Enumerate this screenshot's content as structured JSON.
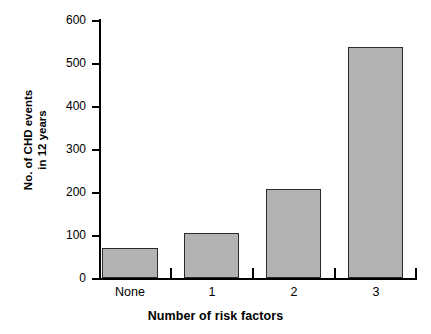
{
  "chart_data": {
    "type": "bar",
    "title": "",
    "subtitle": "",
    "xlabel": "Number of risk factors",
    "ylabel": "No. of CHD events in 12 years",
    "ylabel_lines": [
      "No. of CHD events",
      "in 12 years"
    ],
    "categories": [
      "None",
      "1",
      "2",
      "3"
    ],
    "values": [
      70,
      105,
      207,
      537
    ],
    "ylim": [
      0,
      600
    ],
    "yticks": [
      0,
      100,
      200,
      300,
      400,
      500,
      600
    ],
    "ytick_labels": [
      "0",
      "100",
      "200",
      "300",
      "400",
      "500",
      "600"
    ],
    "xtick_labels": [
      "None",
      "1",
      "2",
      "3"
    ],
    "grid": false,
    "legend": null,
    "legend_position": "none",
    "bar_fill_color": "#b3b3b3",
    "bar_edge_color": "#2b2b2b",
    "axis_color": "#000000",
    "background_color": "#ffffff"
  }
}
